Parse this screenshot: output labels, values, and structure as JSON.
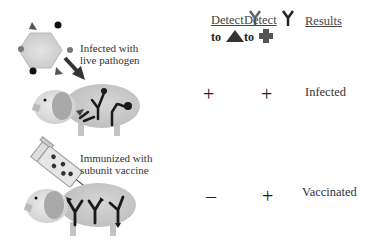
{
  "left_panel": {
    "infection_label_line1": "Infected with",
    "infection_label_line2": "live pathogen",
    "vaccine_label_line1": "Immunized with",
    "vaccine_label_line2": "subunit vaccine"
  },
  "table": {
    "headers": [
      {
        "label": "Detect",
        "icon": "antibody-icon",
        "target_prefix": "to",
        "target_icon": "triangle-antigen-icon"
      },
      {
        "label": "Detect",
        "icon": "antibody-icon",
        "target_prefix": "to",
        "target_icon": "cross-antigen-icon"
      },
      {
        "label": "Results"
      }
    ],
    "rows": [
      {
        "col1": "+",
        "col2": "+",
        "result": "Infected"
      },
      {
        "col1": "–",
        "col2": "+",
        "result": "Vaccinated"
      }
    ]
  },
  "colors": {
    "pig_body": "#c8c8c8",
    "pig_head": "#dcdcdc",
    "ear": "#a8a8a8",
    "antibody": "#1a1a1a",
    "virus": "#d6d6d6",
    "triangle_antigen": "#333333",
    "cross_antigen": "#555555"
  }
}
